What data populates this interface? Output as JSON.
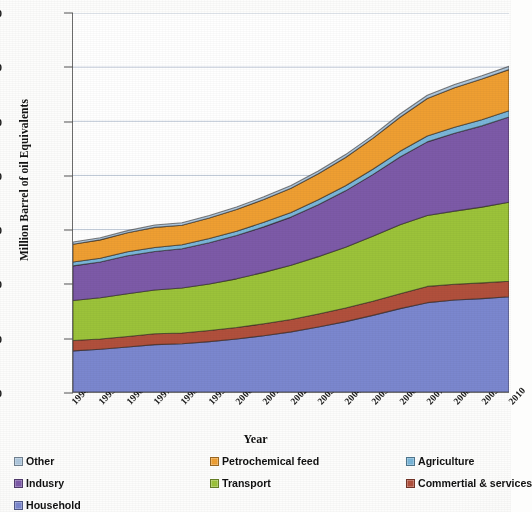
{
  "chart_data": {
    "type": "area",
    "stacked": true,
    "title": "",
    "xlabel": "Year",
    "ylabel": "Million Barrel of oil Equivalents",
    "xlim": [
      1994,
      2010
    ],
    "ylim": [
      0,
      1400
    ],
    "ytick_step": 200,
    "yticks": [
      0,
      200,
      400,
      600,
      800,
      1000,
      1200,
      1400
    ],
    "grid": true,
    "grid_axis": "y",
    "legend_position": "bottom",
    "legend_columns": 3,
    "x": [
      1994,
      1995,
      1996,
      1997,
      1998,
      1999,
      2000,
      2001,
      2002,
      2003,
      2004,
      2005,
      2006,
      2007,
      2008,
      2009,
      2010
    ],
    "categories": [
      "1994",
      "1995",
      "1996",
      "1997",
      "1998",
      "1999",
      "2000",
      "2001",
      "2002",
      "2003",
      "2004",
      "2005",
      "2006",
      "2007",
      "2008",
      "2009",
      "2010"
    ],
    "stack_order_bottom_to_top": [
      "Household",
      "Commertial & services",
      "Transport",
      "Indusry",
      "Agriculture",
      "Petrochemical feed",
      "Other"
    ],
    "series": [
      {
        "name": "Household",
        "color": "#7b87cf",
        "values": [
          152,
          158,
          166,
          175,
          178,
          186,
          196,
          208,
          222,
          240,
          260,
          283,
          308,
          330,
          340,
          345,
          352
        ]
      },
      {
        "name": "Commertial & services",
        "color": "#b1503c",
        "values": [
          38,
          38,
          39,
          40,
          40,
          41,
          42,
          44,
          46,
          48,
          50,
          52,
          55,
          60,
          58,
          58,
          57
        ]
      },
      {
        "name": "Transport",
        "color": "#97cззa",
        "values": [
          148,
          152,
          158,
          162,
          166,
          172,
          180,
          190,
          200,
          212,
          225,
          240,
          255,
          262,
          270,
          280,
          292
        ]
      },
      {
        "name": "Indusry",
        "color": "#7d5aa8",
        "values": [
          128,
          132,
          140,
          142,
          145,
          152,
          160,
          168,
          178,
          192,
          208,
          228,
          250,
          272,
          288,
          300,
          315
        ]
      },
      {
        "name": "Agriculture",
        "color": "#7ab6d9",
        "values": [
          14,
          14,
          15,
          15,
          15,
          16,
          16,
          17,
          17,
          18,
          19,
          20,
          21,
          22,
          22,
          23,
          23
        ]
      },
      {
        "name": "Petrochemical feed",
        "color": "#ef9f32",
        "values": [
          66,
          68,
          70,
          74,
          72,
          76,
          80,
          84,
          90,
          96,
          104,
          114,
          126,
          138,
          146,
          150,
          152
        ]
      },
      {
        "name": "Other",
        "color": "#aec7dd",
        "values": [
          8,
          8,
          8,
          9,
          9,
          9,
          9,
          10,
          10,
          10,
          11,
          11,
          12,
          12,
          12,
          12,
          12
        ]
      }
    ],
    "totals": [
      554,
      570,
      596,
      617,
      625,
      652,
      683,
      721,
      763,
      816,
      877,
      948,
      1027,
      1096,
      1136,
      1168,
      1203
    ]
  },
  "axes": {
    "ytick_labels": [
      "1400",
      "1200",
      "1000",
      "800",
      "600",
      "400",
      "200",
      "0"
    ],
    "xtick_labels": [
      "1994",
      "1995",
      "1996",
      "1997",
      "1998",
      "1999",
      "2000",
      "2001",
      "2002",
      "2003",
      "2004",
      "2005",
      "2006",
      "2007",
      "2008",
      "2009",
      "2010"
    ],
    "xlabel": "Year",
    "ylabel": "Million Barrel of oil Equivalents"
  },
  "legend": {
    "entries": [
      {
        "label": "Other",
        "color": "#aec7dd",
        "col": 0,
        "row": 0
      },
      {
        "label": "Petrochemical feed",
        "color": "#ef9f32",
        "col": 1,
        "row": 0
      },
      {
        "label": "Agriculture",
        "color": "#7ab6d9",
        "col": 2,
        "row": 0
      },
      {
        "label": "Indusry",
        "color": "#7d5aa8",
        "col": 0,
        "row": 1
      },
      {
        "label": "Transport",
        "color": "#9cc33a",
        "col": 1,
        "row": 1
      },
      {
        "label": "Commertial & services",
        "color": "#b1503c",
        "col": 2,
        "row": 1
      },
      {
        "label": "Household",
        "color": "#7b87cf",
        "col": 0,
        "row": 2
      }
    ]
  },
  "colors": {
    "household": "#7b87cf",
    "commercial_services": "#b1503c",
    "transport": "#9cc33a",
    "industry": "#7d5aa8",
    "agriculture": "#7ab6d9",
    "petrochemical_feed": "#ef9f32",
    "other": "#aec7dd",
    "axis": "#6e6e6e",
    "grid": "#b9c4d4",
    "text": "#141414",
    "background": "#ffffff"
  }
}
